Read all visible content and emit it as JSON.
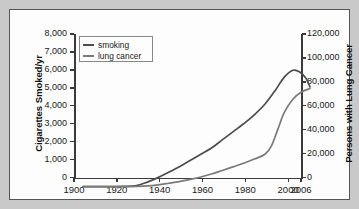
{
  "chart_data": {
    "type": "line",
    "title": "",
    "subtitle": "",
    "xlabel": "",
    "ylabel": "Cigarettes Smoked/yr",
    "ylabel_right": "Persons with Lung Cancer",
    "xlim": [
      1900,
      2006
    ],
    "ylim": [
      0,
      8000
    ],
    "ylim_right": [
      0,
      120000
    ],
    "grid": false,
    "legend_position": "top-left",
    "xticks": [
      1900,
      1920,
      1940,
      1960,
      1980,
      2000,
      2006
    ],
    "xticklabels": [
      "1900",
      "1920",
      "1940",
      "1960",
      "1980",
      "2000",
      "2006"
    ],
    "yticks": [
      0,
      1000,
      2000,
      3000,
      4000,
      5000,
      6000,
      7000,
      8000
    ],
    "yticklabels": [
      "0",
      "1,000",
      "2,000",
      "3,000",
      "4,000",
      "5,000",
      "6,000",
      "7,000",
      "8,000"
    ],
    "yticks_right": [
      0,
      20000,
      40000,
      60000,
      80000,
      100000,
      120000
    ],
    "yticklabels_right": [
      "0",
      "20,000",
      "40,000",
      "60,000",
      "80,000",
      "100,000",
      "120,000"
    ],
    "series": [
      {
        "name": "smoking",
        "axis": "left",
        "color": "#4d4d4d",
        "x": [
          1900,
          1910,
          1920,
          1925,
          1930,
          1935,
          1940,
          1945,
          1950,
          1955,
          1960,
          1965,
          1970,
          1975,
          1980,
          1985,
          1990,
          1994,
          1998,
          2001,
          2004,
          2006
        ],
        "values": [
          0,
          0,
          10,
          60,
          250,
          500,
          800,
          1100,
          1450,
          1800,
          2150,
          2600,
          3050,
          3500,
          4000,
          4600,
          5400,
          6100,
          6480,
          6400,
          6050,
          5550
        ]
      },
      {
        "name": "lung cancer",
        "axis": "right",
        "color": "#7a7a7a",
        "x": [
          1900,
          1910,
          1920,
          1925,
          1930,
          1935,
          1940,
          1945,
          1950,
          1955,
          1960,
          1965,
          1970,
          1975,
          1980,
          1985,
          1988,
          1991,
          1994,
          1998,
          2002,
          2006
        ],
        "values": [
          0,
          0,
          0,
          200,
          600,
          1500,
          2800,
          4200,
          6000,
          8000,
          10500,
          13500,
          16500,
          19500,
          23000,
          27000,
          34000,
          48000,
          62000,
          73000,
          79000,
          82000
        ]
      }
    ],
    "legend": [
      {
        "label": "smoking",
        "color": "#4d4d4d"
      },
      {
        "label": "lung cancer",
        "color": "#7a7a7a"
      }
    ]
  },
  "axes": {
    "left_title": "Cigarettes Smoked/yr",
    "right_title": "Persons with Lung Cancer",
    "left_ticks": [
      {
        "label": "8,000"
      },
      {
        "label": "7,000"
      },
      {
        "label": "6,000"
      },
      {
        "label": "5,000"
      },
      {
        "label": "4,000"
      },
      {
        "label": "3,000"
      },
      {
        "label": "2,000"
      },
      {
        "label": "1,000"
      },
      {
        "label": "0"
      }
    ],
    "right_ticks": [
      {
        "label": "120,000"
      },
      {
        "label": "100,000"
      },
      {
        "label": "80,000"
      },
      {
        "label": "60,000"
      },
      {
        "label": "40,000"
      },
      {
        "label": "20,000"
      },
      {
        "label": "0"
      }
    ],
    "x_ticks": [
      {
        "label": "1900"
      },
      {
        "label": "1920"
      },
      {
        "label": "1940"
      },
      {
        "label": "1960"
      },
      {
        "label": "1980"
      },
      {
        "label": "2000"
      },
      {
        "label": "2006"
      }
    ]
  },
  "legend": {
    "items": [
      {
        "label": "smoking"
      },
      {
        "label": "lung cancer"
      }
    ]
  },
  "colors": {
    "smoking_line": "#4d4d4d",
    "lung_cancer_line": "#7a7a7a",
    "axis": "#3a3a3a",
    "card_background": "#fdfdfd",
    "page_background": "#c9c9c9",
    "frame": "#555555"
  }
}
